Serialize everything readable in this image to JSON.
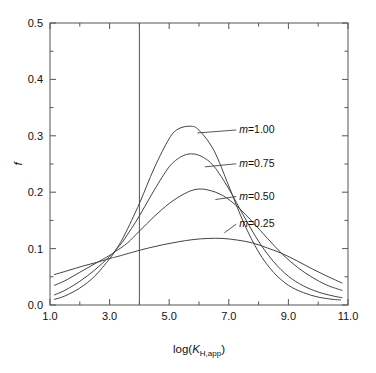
{
  "chart_data": {
    "type": "line",
    "title": "",
    "subtitle": "",
    "xlabel": "log(K_H,app)",
    "xlabel_parts": {
      "prefix": "log(",
      "symbol": "K",
      "subscript": "H,app",
      "suffix": ")"
    },
    "ylabel": "f",
    "xlim": [
      1.0,
      11.0
    ],
    "ylim": [
      0.0,
      0.5
    ],
    "xticks": [
      1.0,
      3.0,
      5.0,
      7.0,
      9.0,
      11.0
    ],
    "xtick_labels": [
      "1.0",
      "3.0",
      "5.0",
      "7.0",
      "9.0",
      "11.0"
    ],
    "xminor_ticks": [
      2.0,
      4.0,
      6.0,
      8.0,
      10.0
    ],
    "yticks": [
      0.0,
      0.1,
      0.2,
      0.3,
      0.4,
      0.5
    ],
    "ytick_labels": [
      "0.0",
      "0.1",
      "0.2",
      "0.3",
      "0.4",
      "0.5"
    ],
    "yminor_ticks": [
      0.05,
      0.15,
      0.25,
      0.35,
      0.45
    ],
    "grid": false,
    "legend_position": "inline-annotations",
    "annotations": [
      {
        "text": "m=1.00",
        "x": 7.35,
        "y": 0.305
      },
      {
        "text": "m=0.75",
        "x": 7.35,
        "y": 0.245
      },
      {
        "text": "m=0.50",
        "x": 7.35,
        "y": 0.187
      },
      {
        "text": "m=0.25",
        "x": 7.35,
        "y": 0.138
      }
    ],
    "vertical_reference_line": {
      "x": 4.0,
      "label": ""
    },
    "series": [
      {
        "name": "m=1.00",
        "m": 1.0,
        "peak_x": 5.7,
        "peak_y": 0.317,
        "label_anchor": {
          "x": 5.95,
          "y": 0.305
        },
        "x": [
          1.15,
          1.5,
          2.0,
          2.5,
          3.0,
          3.2,
          3.5,
          4.0,
          4.5,
          5.0,
          5.3,
          5.7,
          6.0,
          6.5,
          7.0,
          7.5,
          8.0,
          8.5,
          9.0,
          9.5,
          10.0,
          10.5,
          10.75
        ],
        "values": [
          0.01,
          0.016,
          0.03,
          0.051,
          0.082,
          0.097,
          0.124,
          0.18,
          0.243,
          0.295,
          0.312,
          0.317,
          0.31,
          0.274,
          0.211,
          0.146,
          0.094,
          0.058,
          0.035,
          0.022,
          0.014,
          0.01,
          0.009
        ]
      },
      {
        "name": "m=0.75",
        "m": 0.75,
        "peak_x": 5.75,
        "peak_y": 0.268,
        "label_anchor": {
          "x": 6.2,
          "y": 0.245
        },
        "x": [
          1.15,
          1.5,
          2.0,
          2.5,
          3.0,
          3.2,
          3.5,
          4.0,
          4.5,
          5.0,
          5.4,
          5.75,
          6.1,
          6.5,
          7.0,
          7.5,
          8.0,
          8.5,
          9.0,
          9.5,
          10.0,
          10.5,
          10.8
        ],
        "values": [
          0.018,
          0.026,
          0.042,
          0.062,
          0.086,
          0.097,
          0.117,
          0.158,
          0.204,
          0.245,
          0.263,
          0.268,
          0.263,
          0.246,
          0.206,
          0.158,
          0.113,
          0.077,
          0.051,
          0.034,
          0.023,
          0.016,
          0.013
        ]
      },
      {
        "name": "m=0.50",
        "m": 0.5,
        "peak_x": 5.9,
        "peak_y": 0.205,
        "label_anchor": {
          "x": 6.55,
          "y": 0.187
        },
        "x": [
          1.15,
          1.5,
          2.0,
          2.5,
          3.0,
          3.2,
          3.6,
          4.0,
          4.5,
          5.0,
          5.5,
          5.9,
          6.3,
          6.8,
          7.3,
          7.8,
          8.3,
          8.8,
          9.3,
          9.8,
          10.3,
          10.8
        ],
        "values": [
          0.035,
          0.043,
          0.058,
          0.073,
          0.088,
          0.095,
          0.11,
          0.131,
          0.157,
          0.18,
          0.197,
          0.205,
          0.204,
          0.194,
          0.174,
          0.147,
          0.118,
          0.09,
          0.067,
          0.049,
          0.035,
          0.026
        ]
      },
      {
        "name": "m=0.25",
        "m": 0.25,
        "peak_x": 6.3,
        "peak_y": 0.118,
        "label_anchor": {
          "x": 6.85,
          "y": 0.128
        },
        "x": [
          1.15,
          1.6,
          2.1,
          2.6,
          3.1,
          3.2,
          3.8,
          4.3,
          4.8,
          5.3,
          5.8,
          6.3,
          6.8,
          7.3,
          7.8,
          8.3,
          8.8,
          9.3,
          9.8,
          10.3,
          10.8
        ],
        "values": [
          0.054,
          0.061,
          0.069,
          0.076,
          0.084,
          0.085,
          0.094,
          0.101,
          0.107,
          0.112,
          0.116,
          0.118,
          0.118,
          0.115,
          0.11,
          0.101,
          0.091,
          0.078,
          0.064,
          0.051,
          0.039
        ]
      }
    ],
    "colors": {
      "curve": "#444444",
      "axis": "#555555",
      "text": "#111111",
      "background": "#ffffff"
    }
  }
}
